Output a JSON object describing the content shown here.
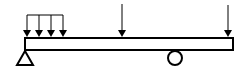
{
  "diagram": {
    "type": "beam-loading",
    "colors": {
      "stroke": "#000000",
      "background": "#ffffff"
    },
    "beam": {
      "x1": 25,
      "x2": 233,
      "y_top": 38,
      "y_bottom": 50
    },
    "distributed_load": {
      "x_start": 27,
      "x_end": 63,
      "arrows_x": [
        27,
        39,
        51,
        63
      ],
      "top_y": 15,
      "tip_y": 37
    },
    "point_loads": [
      {
        "name": "middle-point-load",
        "x": 122,
        "top_y": 4,
        "tip_y": 37
      },
      {
        "name": "end-point-load",
        "x": 228,
        "top_y": 5,
        "tip_y": 37
      }
    ],
    "supports": {
      "pin": {
        "apex_x": 25,
        "apex_y": 50,
        "base_y": 65,
        "half_width": 8
      },
      "roller": {
        "cx": 175,
        "cy": 61,
        "r": 7
      }
    }
  }
}
